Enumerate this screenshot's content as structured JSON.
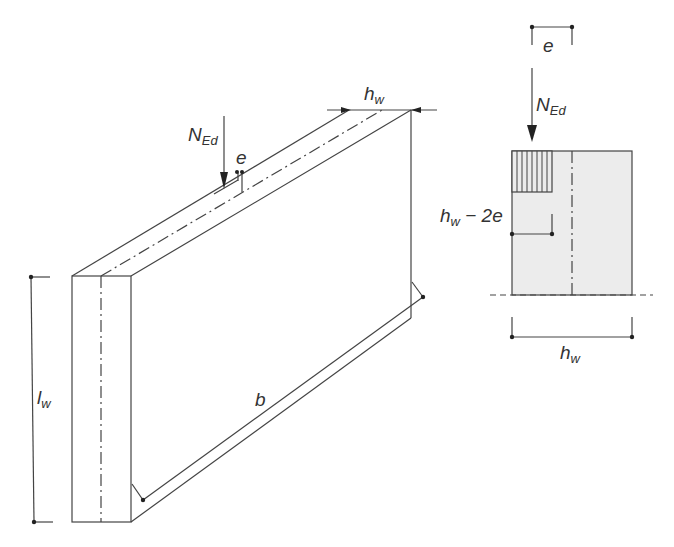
{
  "diagram": {
    "type": "structural-engineering-figure",
    "colors": {
      "line": "#444444",
      "section_fill": "#ececec",
      "background": "#ffffff"
    },
    "left_view": {
      "name": "wall-isometric",
      "labels": {
        "load_symbol": "N",
        "load_subscript": "Ed",
        "eccentricity": "e",
        "thickness_symbol": "h",
        "thickness_subscript": "w",
        "height_symbol": "l",
        "height_subscript": "w",
        "length": "b"
      }
    },
    "right_view": {
      "name": "wall-cross-section",
      "labels": {
        "eccentricity": "e",
        "load_symbol": "N",
        "load_subscript": "Ed",
        "effective_width_symbol": "h",
        "effective_width_subscript": "w",
        "effective_width_suffix": " − 2e",
        "thickness_symbol": "h",
        "thickness_subscript": "w"
      }
    }
  }
}
